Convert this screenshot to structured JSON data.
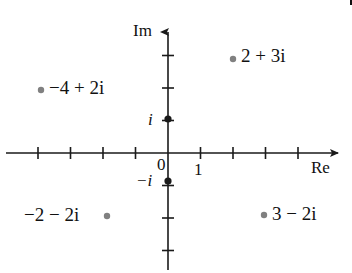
{
  "figure": {
    "width": 352,
    "height": 273,
    "background": "#ffffff",
    "axis_color": "#1a1a1a",
    "point_color": "#808080",
    "text_color": "#111111"
  },
  "axes": {
    "real": {
      "label": "Re",
      "label_x": 311,
      "label_y": 159,
      "y": 153,
      "x_start": 6,
      "x_end": 344,
      "arrow": "right"
    },
    "imaginary": {
      "label": "Im",
      "label_x": 133,
      "label_y": 22,
      "x": 168,
      "y_start": 26,
      "y_end": 270,
      "arrow": "up"
    },
    "origin": {
      "x": 168,
      "y": 153
    },
    "unit_px": 32.5,
    "tick_half_len": 6
  },
  "tick_labels": [
    {
      "name": "origin-label",
      "text": "0",
      "x": 157,
      "y": 156
    },
    {
      "name": "one-label",
      "text": "1",
      "x": 194,
      "y": 161
    },
    {
      "name": "i-label",
      "text": "i",
      "x": 148,
      "y": 111,
      "italic": true
    },
    {
      "name": "minus-i-label",
      "text": "−i",
      "x": 136,
      "y": 172,
      "italic": false
    }
  ],
  "chart_data": {
    "type": "scatter",
    "title": "",
    "xlabel": "Re",
    "ylabel": "Im",
    "xlim": [
      -5,
      5.5
    ],
    "ylim": [
      -4,
      4
    ],
    "grid": false,
    "legend": null,
    "axis_ticks_x": [
      -4,
      -3,
      -2,
      -1,
      1,
      2,
      3,
      4
    ],
    "axis_ticks_y": [
      -3,
      -2,
      -1,
      1,
      2,
      3
    ],
    "labeled_ticks_x": [
      "0",
      "1"
    ],
    "labeled_ticks_y": [
      "i",
      "−i"
    ],
    "points": [
      {
        "name": "point-2-plus-3i",
        "label": "2 + 3i",
        "re": 2,
        "im": 3,
        "px": 233,
        "py": 59,
        "label_x": 241,
        "label_y": 46,
        "label_align": "left"
      },
      {
        "name": "point-minus4-plus-2i",
        "label": "−4 + 2i",
        "re": -4,
        "im": 2,
        "px": 41,
        "py": 90,
        "label_x": 49,
        "label_y": 78,
        "label_align": "left"
      },
      {
        "name": "point-i",
        "label": "i",
        "re": 0,
        "im": 1,
        "px": 168,
        "py": 119,
        "label_x": null,
        "label_y": null,
        "label_align": "axis"
      },
      {
        "name": "point-minus-i",
        "label": "−i",
        "re": 0,
        "im": -1,
        "px": 168,
        "py": 181,
        "label_x": null,
        "label_y": null,
        "label_align": "axis"
      },
      {
        "name": "point-minus2-minus-2i",
        "label": "−2 − 2i",
        "re": -2,
        "im": -2,
        "px": 107,
        "py": 216,
        "label_x": 24,
        "label_y": 205,
        "label_align": "right"
      },
      {
        "name": "point-3-minus-2i",
        "label": "3 − 2i",
        "re": 3,
        "im": -2,
        "px": 264,
        "py": 215,
        "label_x": 272,
        "label_y": 204,
        "label_align": "left"
      }
    ]
  },
  "artifact": {
    "name": "corner-mark",
    "x": 330,
    "y": 0,
    "width": 20,
    "height": 5
  }
}
